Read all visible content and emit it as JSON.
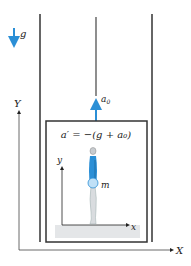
{
  "diagram": {
    "gravity_label": "g",
    "cable_accel_label": "a",
    "cable_accel_sub": "0",
    "equation": "a′ = −(g + a₀)",
    "inner_axis_y": "y",
    "inner_axis_x": "x",
    "mass_label": "m",
    "outer_axis_y": "Y",
    "outer_axis_x": "X"
  },
  "colors": {
    "accent_blue": "#2b8fd6",
    "line": "#333333",
    "floor": "#e4e6e8"
  }
}
